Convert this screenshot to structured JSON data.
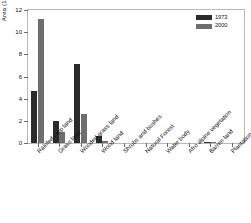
{
  "chart_data": {
    "type": "bar",
    "title": "",
    "xlabel": "",
    "ylabel": "Area (1000 km",
    "ylabel_sup": "2",
    "ylabel_suffix": ")",
    "ylim": [
      0,
      12
    ],
    "yticks": [
      0,
      2,
      4,
      6,
      8,
      10,
      12
    ],
    "grid": false,
    "legend_position": "top-right",
    "categories": [
      "Rainfed crop land",
      "Grass land",
      "Wooded grass land",
      "Wood land",
      "Shrubs and bushes",
      "Natural Forest",
      "Water body",
      "Afro alpine vegetation",
      "Barren land",
      "Plantation Forest"
    ],
    "series": [
      {
        "name": "1973",
        "color": "#2b2b2b",
        "values": [
          4.7,
          2.0,
          7.1,
          0.6,
          0.0,
          0.0,
          0.0,
          0.0,
          0.1,
          0.0
        ]
      },
      {
        "name": "2000",
        "color": "#6e6e6e",
        "values": [
          11.2,
          1.0,
          2.6,
          0.15,
          0.0,
          0.0,
          0.0,
          0.0,
          0.12,
          0.0
        ]
      }
    ]
  },
  "legend": {
    "entries": [
      {
        "label": "1973"
      },
      {
        "label": "2000"
      }
    ]
  }
}
